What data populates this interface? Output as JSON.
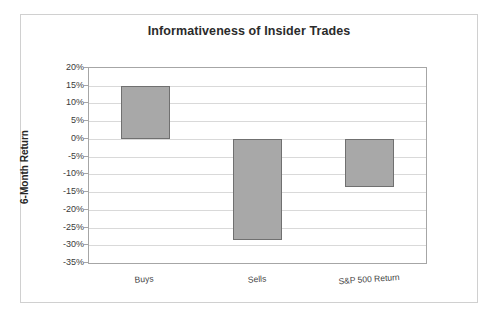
{
  "chart_data": {
    "type": "bar",
    "title": "Informativeness of Insider Trades",
    "xlabel": "",
    "ylabel": "6-Month Return",
    "categories": [
      "Buys",
      "Sells",
      "S&P 500 Return"
    ],
    "values": [
      15.0,
      -28.5,
      -13.5
    ],
    "value_labels": [
      "15%",
      "-28.5%",
      "-13.5%"
    ],
    "ylim": [
      -35,
      20
    ],
    "ytick_values": [
      20,
      15,
      10,
      5,
      0,
      -5,
      -10,
      -15,
      -20,
      -25,
      -30,
      -35
    ],
    "ytick_labels": [
      "20%",
      "15%",
      "10%",
      "5%",
      "0%",
      "-5%",
      "-10%",
      "-15%",
      "-20%",
      "-25%",
      "-30%",
      "-35%"
    ],
    "grid": true,
    "legend": false,
    "legend_position": "none",
    "series": [
      {
        "name": "6-Month Return",
        "values": [
          15.0,
          -28.5,
          -13.5
        ]
      }
    ],
    "colors": {
      "bar_fill": "#a8a8a8",
      "bar_border": "#707070",
      "gridline": "#d9d9d9",
      "axis": "#a6a6a6",
      "title_text": "#2b2b2b",
      "tick_text": "#3a3a3a",
      "frame": "#d0d0d0",
      "background": "#ffffff"
    }
  }
}
